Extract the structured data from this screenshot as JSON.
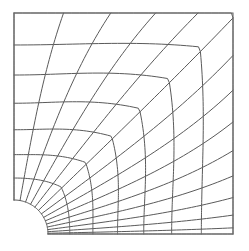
{
  "figure": {
    "kind": "mesh-diagram",
    "background_color": "#ffffff",
    "line_color": "#5a5a5a",
    "boundary_color": "#6b6b6b",
    "line_width": 1
  },
  "geometry": {
    "plate_left": 14,
    "plate_top": 13,
    "plate_right": 233,
    "plate_bottom": 234,
    "plate_width": 219,
    "plate_height": 221,
    "hole_center_x": 14,
    "hole_center_y": 234,
    "hole_radius": 34,
    "hole_quadrant": "bottom-left",
    "angle_start_deg": 0,
    "angle_end_deg": 90
  },
  "mesh": {
    "radial_divisions": 7,
    "circumferential_divisions": 14,
    "radial_grading": 1.55,
    "circumferential_grading_exponent": 1.62,
    "element_count": 98,
    "node_rows": 8,
    "node_cols": 15
  },
  "chart_data": {
    "type": "mesh",
    "grid": true,
    "legend": null,
    "hole_boundary_nodes": 15,
    "outer_boundary_nodes": 15,
    "radial_rings": 8
  }
}
